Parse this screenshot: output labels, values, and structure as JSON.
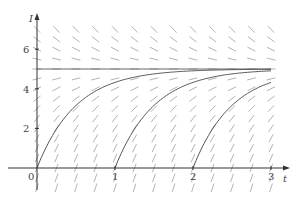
{
  "chart_data": {
    "type": "line",
    "title": "",
    "subtitle": "Direction field for dI/dt = 10 - 2I with solution curves",
    "xlabel": "t",
    "ylabel": "I",
    "xlim": [
      0,
      3.1
    ],
    "ylim": [
      -0.8,
      7.3
    ],
    "x_ticks": [
      0,
      1,
      2,
      3
    ],
    "y_ticks": [
      2,
      4,
      6
    ],
    "tick_labels_x": [
      "0",
      "1",
      "2",
      "3"
    ],
    "tick_labels_y": [
      "2",
      "4",
      "6"
    ],
    "grid": false,
    "legend": null,
    "equilibrium": 5,
    "slope_field": {
      "equation": "dI/dt = 10 - 2I",
      "t_step": 0.25,
      "I_step": 0.5,
      "t_range": [
        0,
        3
      ],
      "I_range": [
        -1,
        7
      ]
    },
    "series": [
      {
        "name": "solution from t=0",
        "start_t": 0,
        "formula": "I = 5(1 - e^(-2t))",
        "x": [
          0,
          0.25,
          0.5,
          0.75,
          1,
          1.5,
          2,
          3
        ],
        "y": [
          0,
          1.97,
          3.16,
          3.88,
          4.32,
          4.75,
          4.91,
          4.99
        ]
      },
      {
        "name": "solution from t=1",
        "start_t": 1,
        "formula": "I = 5(1 - e^(-2(t-1)))",
        "x": [
          1,
          1.25,
          1.5,
          1.75,
          2,
          2.5,
          3
        ],
        "y": [
          0,
          1.97,
          3.16,
          3.88,
          4.32,
          4.75,
          4.91
        ]
      },
      {
        "name": "solution from t=2",
        "start_t": 2,
        "formula": "I = 5(1 - e^(-2(t-2)))",
        "x": [
          2,
          2.25,
          2.5,
          2.75,
          3
        ],
        "y": [
          0,
          1.97,
          3.16,
          3.88,
          4.32
        ]
      }
    ]
  },
  "colors": {
    "axis": "#333333",
    "field": "#aaaaaa",
    "curve": "#555555",
    "equilibrium": "#666666"
  }
}
